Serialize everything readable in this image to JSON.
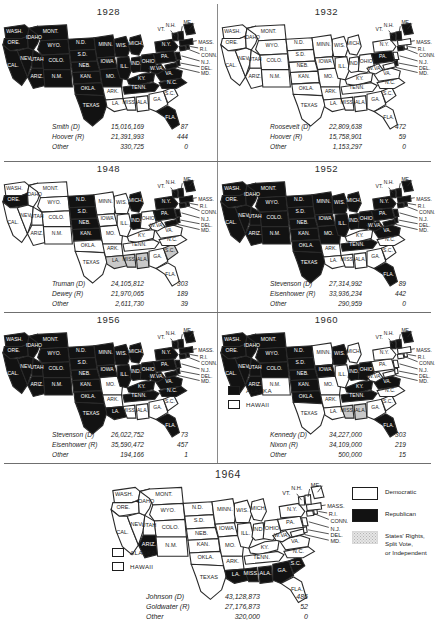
{
  "legend": {
    "items": [
      {
        "swatch": "democratic-swatch",
        "label": "Democratic"
      },
      {
        "swatch": "republican-swatch",
        "label": "Republican"
      },
      {
        "swatch": "other-swatch",
        "label": "States' Rights,\nSplit Vote,\nor Independent"
      }
    ]
  },
  "columns": {
    "candidate": "",
    "popular": "",
    "electoral": ""
  },
  "elections": [
    {
      "year": "1928",
      "rows": [
        {
          "candidate": "Smith (D)",
          "popular": "15,016,169",
          "electoral": "87"
        },
        {
          "candidate": "Hoover (R)",
          "popular": "21,391,993",
          "electoral": "444"
        },
        {
          "candidate": "Other",
          "popular": "330,725",
          "electoral": "0"
        }
      ],
      "republican_states": [
        "WASH",
        "ORE",
        "IDAHO",
        "MONT",
        "WYO",
        "ND",
        "SD",
        "NEB",
        "KAN",
        "OKLA",
        "NEV",
        "UTAH",
        "COLO",
        "CAL",
        "ARIZ",
        "NM",
        "TEXAS",
        "MINN",
        "IOWA",
        "WIS",
        "MICH",
        "ILL",
        "IND",
        "OHIO",
        "MO",
        "KY",
        "TENN",
        "WVA",
        "VA",
        "NC",
        "PA",
        "NY",
        "NJ",
        "DEL",
        "MD",
        "CONN",
        "RI",
        "MASS",
        "VT",
        "NH",
        "ME",
        "FLA"
      ],
      "democratic_states": [
        "ARK",
        "LA",
        "MISS",
        "ALA",
        "GA",
        "SC"
      ],
      "other_states": []
    },
    {
      "year": "1932",
      "rows": [
        {
          "candidate": "Roosevelt (D)",
          "popular": "22,809,638",
          "electoral": "472"
        },
        {
          "candidate": "Hoover (R)",
          "popular": "15,758,901",
          "electoral": "59"
        },
        {
          "candidate": "Other",
          "popular": "1,153,297",
          "electoral": "0"
        }
      ],
      "republican_states": [
        "ME",
        "NH",
        "VT",
        "CONN",
        "DEL",
        "PA"
      ],
      "democratic_states": [
        "WASH",
        "ORE",
        "IDAHO",
        "MONT",
        "WYO",
        "ND",
        "SD",
        "NEB",
        "KAN",
        "OKLA",
        "NEV",
        "UTAH",
        "COLO",
        "CAL",
        "ARIZ",
        "NM",
        "TEXAS",
        "MINN",
        "IOWA",
        "WIS",
        "MICH",
        "ILL",
        "IND",
        "OHIO",
        "MO",
        "KY",
        "TENN",
        "WVA",
        "VA",
        "NC",
        "ARK",
        "LA",
        "MISS",
        "ALA",
        "GA",
        "SC",
        "FLA",
        "NY",
        "NJ",
        "MD",
        "RI",
        "MASS"
      ],
      "other_states": []
    },
    {
      "year": "1948",
      "rows": [
        {
          "candidate": "Truman (D)",
          "popular": "24,105,812",
          "electoral": "303"
        },
        {
          "candidate": "Dewey (R)",
          "popular": "21,970,065",
          "electoral": "189"
        },
        {
          "candidate": "Other",
          "popular": "2,611,730",
          "electoral": "39"
        }
      ],
      "republican_states": [
        "ORE",
        "ND",
        "SD",
        "NEB",
        "KAN",
        "MICH",
        "IND",
        "PA",
        "NY",
        "NJ",
        "CONN",
        "DEL",
        "MD",
        "VT",
        "NH",
        "ME",
        "MASS",
        "RI"
      ],
      "democratic_states": [
        "WASH",
        "IDAHO",
        "MONT",
        "WYO",
        "NEV",
        "UTAH",
        "COLO",
        "CAL",
        "ARIZ",
        "NM",
        "TEXAS",
        "OKLA",
        "MINN",
        "IOWA",
        "WIS",
        "ILL",
        "OHIO",
        "MO",
        "ARK",
        "KY",
        "TENN",
        "WVA",
        "VA",
        "NC",
        "GA",
        "FLA"
      ],
      "other_states": [
        "MISS",
        "ALA",
        "LA",
        "SC"
      ]
    },
    {
      "year": "1952",
      "rows": [
        {
          "candidate": "Stevenson (D)",
          "popular": "27,314,992",
          "electoral": "89"
        },
        {
          "candidate": "Eisenhower (R)",
          "popular": "33,936,234",
          "electoral": "442"
        },
        {
          "candidate": "Other",
          "popular": "290,959",
          "electoral": "0"
        }
      ],
      "republican_states": [
        "WASH",
        "ORE",
        "IDAHO",
        "MONT",
        "WYO",
        "ND",
        "SD",
        "NEB",
        "KAN",
        "OKLA",
        "NEV",
        "UTAH",
        "COLO",
        "CAL",
        "ARIZ",
        "NM",
        "TEXAS",
        "MINN",
        "IOWA",
        "WIS",
        "MICH",
        "ILL",
        "IND",
        "OHIO",
        "MO",
        "TENN",
        "WVA",
        "VA",
        "PA",
        "NY",
        "NJ",
        "DEL",
        "MD",
        "CONN",
        "RI",
        "MASS",
        "VT",
        "NH",
        "ME",
        "FLA"
      ],
      "democratic_states": [
        "ARK",
        "LA",
        "MISS",
        "ALA",
        "GA",
        "SC",
        "NC",
        "KY"
      ],
      "other_states": []
    },
    {
      "year": "1956",
      "rows": [
        {
          "candidate": "Stevenson (D)",
          "popular": "26,022,752",
          "electoral": "73"
        },
        {
          "candidate": "Eisenhower (R)",
          "popular": "35,590,472",
          "electoral": "457"
        },
        {
          "candidate": "Other",
          "popular": "194,166",
          "electoral": "1"
        }
      ],
      "republican_states": [
        "WASH",
        "ORE",
        "IDAHO",
        "MONT",
        "WYO",
        "ND",
        "SD",
        "NEB",
        "KAN",
        "OKLA",
        "NEV",
        "UTAH",
        "COLO",
        "CAL",
        "ARIZ",
        "NM",
        "TEXAS",
        "MINN",
        "IOWA",
        "WIS",
        "MICH",
        "ILL",
        "IND",
        "OHIO",
        "KY",
        "TENN",
        "WVA",
        "VA",
        "NC",
        "PA",
        "NY",
        "NJ",
        "DEL",
        "MD",
        "CONN",
        "RI",
        "MASS",
        "VT",
        "NH",
        "ME",
        "FLA",
        "LA"
      ],
      "democratic_states": [
        "MO",
        "ARK",
        "MISS",
        "ALA",
        "GA",
        "SC"
      ],
      "other_states": []
    },
    {
      "year": "1960",
      "rows": [
        {
          "candidate": "Kennedy (D)",
          "popular": "34,227,000",
          "electoral": "303"
        },
        {
          "candidate": "Nixon (R)",
          "popular": "34,109,000",
          "electoral": "219"
        },
        {
          "candidate": "Other",
          "popular": "500,000",
          "electoral": "15"
        }
      ],
      "republican_states": [
        "WASH",
        "ORE",
        "IDAHO",
        "MONT",
        "WYO",
        "ND",
        "SD",
        "NEB",
        "KAN",
        "UTAH",
        "COLO",
        "CAL",
        "ARIZ",
        "IOWA",
        "WIS",
        "IND",
        "OHIO",
        "NH",
        "VT",
        "ME",
        "FLA",
        "TENN",
        "VA",
        "KY",
        "OKLA",
        "NEV"
      ],
      "democratic_states": [
        "NM",
        "TEXAS",
        "MINN",
        "ILL",
        "MICH",
        "MO",
        "ARK",
        "LA",
        "NC",
        "SC",
        "GA",
        "WVA",
        "PA",
        "NY",
        "NJ",
        "DEL",
        "MD",
        "CONN",
        "RI",
        "MASS"
      ],
      "other_states": [
        "MISS",
        "ALA"
      ],
      "insets": [
        {
          "name": "alaska-key",
          "swatch": "black",
          "label": "ALASKA"
        },
        {
          "name": "hawaii-key",
          "swatch": "white",
          "label": "HAWAII"
        }
      ]
    },
    {
      "year": "1964",
      "rows": [
        {
          "candidate": "Johnson (D)",
          "popular": "43,128,873",
          "electoral": "486"
        },
        {
          "candidate": "Goldwater (R)",
          "popular": "27,176,873",
          "electoral": "52"
        },
        {
          "candidate": "Other",
          "popular": "320,000",
          "electoral": "0"
        }
      ],
      "republican_states": [
        "ARIZ",
        "LA",
        "MISS",
        "ALA",
        "GA",
        "SC"
      ],
      "democratic_states": [
        "WASH",
        "ORE",
        "IDAHO",
        "MONT",
        "WYO",
        "ND",
        "SD",
        "NEB",
        "KAN",
        "OKLA",
        "NEV",
        "UTAH",
        "COLO",
        "CAL",
        "NM",
        "TEXAS",
        "MINN",
        "IOWA",
        "WIS",
        "MICH",
        "ILL",
        "IND",
        "OHIO",
        "MO",
        "ARK",
        "KY",
        "TENN",
        "WVA",
        "VA",
        "NC",
        "FLA",
        "PA",
        "NY",
        "NJ",
        "DEL",
        "MD",
        "CONN",
        "RI",
        "MASS",
        "VT",
        "NH",
        "ME"
      ],
      "other_states": [],
      "insets": [
        {
          "name": "alaska-key",
          "swatch": "white",
          "label": "ALASKA"
        },
        {
          "name": "hawaii-key",
          "swatch": "white",
          "label": "HAWAII"
        }
      ]
    }
  ],
  "state_labels": {
    "WASH": "WASH.",
    "ORE": "ORE.",
    "IDAHO": "IDAHO",
    "MONT": "MONT.",
    "WYO": "WYO.",
    "ND": "N.D.",
    "SD": "S.D.",
    "NEB": "NEB.",
    "KAN": "KAN.",
    "OKLA": "OKLA.",
    "NEV": "NEV.",
    "UTAH": "UTAH",
    "COLO": "COLO.",
    "CAL": "CAL.",
    "ARIZ": "ARIZ.",
    "NM": "N.M.",
    "TEXAS": "TEXAS",
    "MINN": "MINN.",
    "IOWA": "IOWA",
    "MO": "MO.",
    "ARK": "ARK.",
    "LA": "LA.",
    "WIS": "WIS.",
    "ILL": "ILL.",
    "MICH": "MICH.",
    "IND": "IND.",
    "OHIO": "OHIO",
    "KY": "KY.",
    "TENN": "TENN.",
    "MISS": "MISS.",
    "ALA": "ALA.",
    "GA": "GA.",
    "FLA": "FLA.",
    "SC": "S.C.",
    "NC": "N.C.",
    "VA": "VA.",
    "WVA": "W.VA.",
    "PA": "PA.",
    "NY": "N.Y.",
    "NJ": "N.J.",
    "DEL": "DEL.",
    "MD": "MD.",
    "CONN": "CONN.",
    "RI": "R.I.",
    "MASS": "MASS.",
    "VT": "VT.",
    "NH": "N.H.",
    "ME": "ME."
  }
}
